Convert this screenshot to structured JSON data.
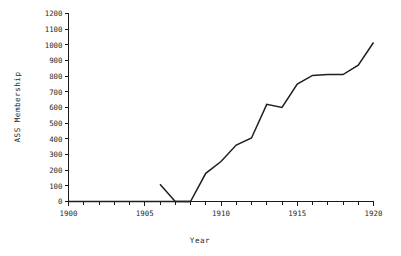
{
  "chart_data": {
    "type": "line",
    "title": "",
    "xlabel": "Year",
    "ylabel": "ASS Membership",
    "xlim": [
      1900,
      1920
    ],
    "ylim": [
      0,
      1200
    ],
    "grid": false,
    "legend": null,
    "x_ticks": [
      1900,
      1905,
      1910,
      1915,
      1920
    ],
    "x_tick_labels": [
      "1900",
      "1905",
      "1910",
      "1915",
      "1920"
    ],
    "x_minor_tick_step": 1,
    "y_ticks": [
      0,
      100,
      200,
      300,
      400,
      500,
      600,
      700,
      800,
      900,
      1000,
      1100,
      1200
    ],
    "y_tick_labels": [
      "0",
      "100",
      "200",
      "300",
      "400",
      "500",
      "600",
      "700",
      "800",
      "900",
      "1000",
      "1100",
      "1200"
    ],
    "line_color": "#1f1f1f",
    "series": [
      {
        "name": "ASS Membership",
        "x": [
          1906,
          1907,
          1908,
          1909,
          1910,
          1911,
          1912,
          1913,
          1914,
          1915,
          1916,
          1917,
          1918,
          1919,
          1920
        ],
        "values": [
          110,
          0,
          0,
          180,
          255,
          360,
          405,
          620,
          600,
          750,
          805,
          810,
          810,
          870,
          1015
        ]
      }
    ],
    "baseline": {
      "name": "zero-baseline",
      "x": [
        1900,
        1908
      ],
      "values": [
        0,
        0
      ]
    }
  },
  "axis": {
    "x_title": "Year",
    "y_title": "ASS Membership"
  }
}
